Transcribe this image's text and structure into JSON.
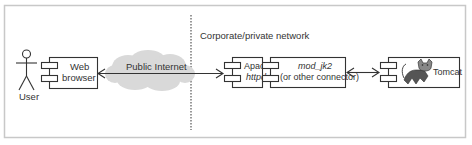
{
  "diagram": {
    "type": "deployment",
    "zones": {
      "public_label": "Public Internet",
      "private_label": "Corporate/private network"
    },
    "actor": {
      "label": "User"
    },
    "components": [
      {
        "id": "web-browser",
        "line1": "Web",
        "line2": "browser"
      },
      {
        "id": "apache",
        "line1": "Apache",
        "line2": "httpd"
      },
      {
        "id": "mod-jk2",
        "line1": "mod_jk2",
        "line2": "(or other connector)"
      },
      {
        "id": "tomcat",
        "line1": "Tomcat"
      }
    ],
    "connections": [
      {
        "from": "web-browser",
        "to": "apache",
        "label": "Public Internet",
        "style": "arrow-both"
      },
      {
        "from": "mod-jk2",
        "to": "tomcat",
        "style": "arrow-both"
      }
    ],
    "colors": {
      "border": "#c8c8c8",
      "line": "#333333",
      "cloud": "#d9d9d9",
      "divider": "#555555"
    }
  }
}
